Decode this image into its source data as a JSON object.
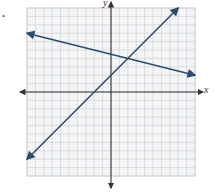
{
  "chart_data": {
    "type": "line",
    "title": "",
    "xlabel": "x",
    "ylabel": "y",
    "xlim": [
      -10,
      10
    ],
    "ylim": [
      -10,
      10
    ],
    "grid": true,
    "grid_step": 1,
    "legend": null,
    "series": [
      {
        "name": "line-1",
        "equation": "y = x + 2",
        "slope": 1,
        "intercept": 2,
        "x": [
          -10,
          8
        ],
        "y": [
          -8,
          10
        ],
        "color": "#2f4a6b"
      },
      {
        "name": "line-2",
        "equation": "y = -0.25x + 4.5",
        "slope": -0.25,
        "intercept": 4.5,
        "x": [
          -10,
          10
        ],
        "y": [
          7,
          2
        ],
        "color": "#2f4a6b"
      }
    ],
    "intersection": {
      "x": 2,
      "y": 4
    }
  },
  "labels": {
    "x_axis": "x",
    "y_axis": "y",
    "bullet": "•"
  },
  "colors": {
    "grid": "#c9ccd0",
    "axis": "#333333",
    "line": "#2f4a6b",
    "bg": "#f4f5f6"
  }
}
